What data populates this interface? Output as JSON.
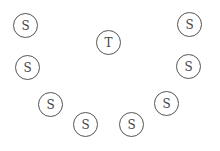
{
  "diagram": {
    "nodes": [
      {
        "id": "s1",
        "label": "S",
        "cx": 25,
        "cy": 25
      },
      {
        "id": "t",
        "label": "T",
        "cx": 108,
        "cy": 42
      },
      {
        "id": "s2",
        "label": "S",
        "cx": 189,
        "cy": 24
      },
      {
        "id": "s3",
        "label": "S",
        "cx": 27,
        "cy": 67
      },
      {
        "id": "s4",
        "label": "S",
        "cx": 188,
        "cy": 66
      },
      {
        "id": "s5",
        "label": "S",
        "cx": 50,
        "cy": 104
      },
      {
        "id": "s6",
        "label": "S",
        "cx": 166,
        "cy": 103
      },
      {
        "id": "s7",
        "label": "S",
        "cx": 85,
        "cy": 124
      },
      {
        "id": "s8",
        "label": "S",
        "cx": 131,
        "cy": 124
      }
    ],
    "stroke_color": "#555555"
  }
}
